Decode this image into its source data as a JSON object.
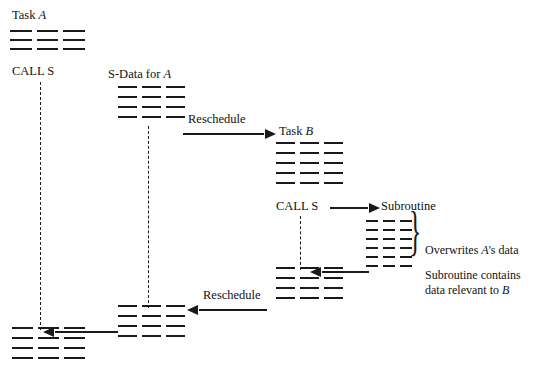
{
  "figure": {
    "type": "diagram",
    "background_color": "#ffffff",
    "ink_color": "#1a1a1a"
  },
  "labels": {
    "task_a": "Task A",
    "task_a_italic": "A",
    "call_s_a": "CALL S",
    "s_data_for_a": "S-Data for A",
    "s_data_italic": "A",
    "reschedule_top": "Reschedule",
    "task_b": "Task B",
    "task_b_italic": "B",
    "call_s_b": "CALL S",
    "subroutine": "Subroutine",
    "overwrites": "Overwrites A's data",
    "overwrites_italic": "A",
    "subroutine_contains_line1": "Subroutine contains",
    "subroutine_contains_line2": "data relevant to B",
    "subroutine_contains_italic": "B",
    "reschedule_bottom": "Reschedule"
  },
  "blocks": [
    {
      "id": "task-a-code",
      "name": "Task A code block",
      "rows": 3,
      "segments": 3
    },
    {
      "id": "s-data-a-top",
      "name": "S-Data for A block",
      "rows": 4,
      "segments": 3
    },
    {
      "id": "task-b-code",
      "name": "Task B code block",
      "rows": 5,
      "segments": 3
    },
    {
      "id": "subroutine-code",
      "name": "Subroutine code block",
      "rows": 6,
      "segments": 3
    },
    {
      "id": "task-b-resume",
      "name": "Task B resumed code block",
      "rows": 4,
      "segments": 3
    },
    {
      "id": "s-data-a-bottom",
      "name": "S-Data for A restored block",
      "rows": 4,
      "segments": 3
    },
    {
      "id": "task-a-resume",
      "name": "Task A resumed code block",
      "rows": 4,
      "segments": 3
    }
  ],
  "connectors": {
    "task_a_call_dashed": "vertical dashed line from Task A CALL S down to resumed Task A",
    "s_data_dashed": "vertical dashed line linking S-Data for A top block to restored bottom block",
    "task_b_call_dashed": "vertical dashed line from Task B CALL S down to resumed Task B"
  },
  "arrows": [
    {
      "id": "reschedule-top-arrow",
      "label": "Reschedule",
      "direction": "right"
    },
    {
      "id": "call-s-subroutine-arrow",
      "label": "",
      "direction": "right"
    },
    {
      "id": "subroutine-return-arrow",
      "label": "",
      "direction": "left"
    },
    {
      "id": "reschedule-bottom-arrow",
      "label": "Reschedule",
      "direction": "left"
    }
  ],
  "brace": {
    "id": "subroutine-brace",
    "glyph": "}"
  }
}
